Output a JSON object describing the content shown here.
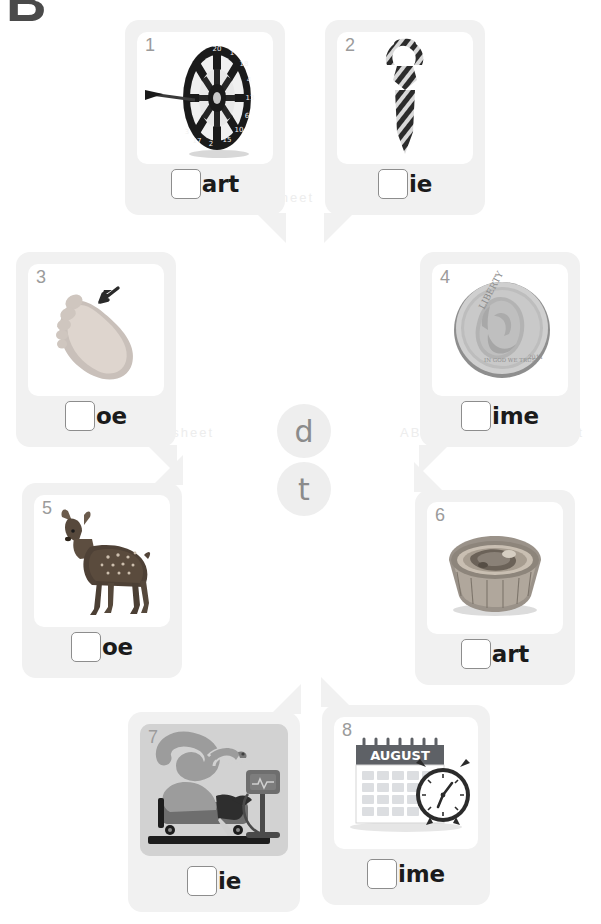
{
  "worksheet": {
    "heading_glyph": "B",
    "center_letters": [
      {
        "letter": "d",
        "name": "letter-circle-d"
      },
      {
        "letter": "t",
        "name": "letter-circle-t"
      }
    ],
    "watermarks": [
      "ABC Phonics Worksheet",
      "ABC Phonics Worksheet",
      "ABC Phonics Worksheet"
    ],
    "cards": [
      {
        "number": "1",
        "ending": "art",
        "image": "dartboard",
        "image_alt": "dart board with dart",
        "tail": "br",
        "tinted": false
      },
      {
        "number": "2",
        "ending": "ie",
        "image": "necktie",
        "image_alt": "striped necktie",
        "tail": "bl",
        "tinted": false
      },
      {
        "number": "3",
        "ending": "oe",
        "image": "foot-toe",
        "image_alt": "bare foot with arrow pointing at toe",
        "tail": "br",
        "tinted": false
      },
      {
        "number": "4",
        "ending": "ime",
        "image": "dime-coin",
        "image_alt": "silver dime coin",
        "tail": "bl",
        "tinted": false
      },
      {
        "number": "5",
        "ending": "oe",
        "image": "deer-doe",
        "image_alt": "spotted deer doe",
        "tail": "tr",
        "tinted": false
      },
      {
        "number": "6",
        "ending": "art",
        "image": "tart-pastry",
        "image_alt": "baked tart pastry",
        "tail": "tl",
        "tinted": false
      },
      {
        "number": "7",
        "ending": "ie",
        "image": "hospital-bed",
        "image_alt": "person in hospital bed with monitor",
        "tail": "tr",
        "tinted": true
      },
      {
        "number": "8",
        "ending": "ime",
        "image": "calendar-clock",
        "image_alt": "August calendar with alarm clock",
        "tail": "tl",
        "tinted": false
      }
    ],
    "calendar_month": "AUGUST",
    "coin_text": {
      "liberty": "LIBERTY",
      "motto": "IN GOD WE TRUST"
    },
    "colors": {
      "bubble": "#f1f1f1",
      "picture": "#ffffff",
      "number": "#9b9b9b",
      "ending": "#1b1b1b",
      "circle_bg": "#eeeeee",
      "circle_text": "#8b8b8b",
      "dot": "#9a9a9a"
    }
  }
}
